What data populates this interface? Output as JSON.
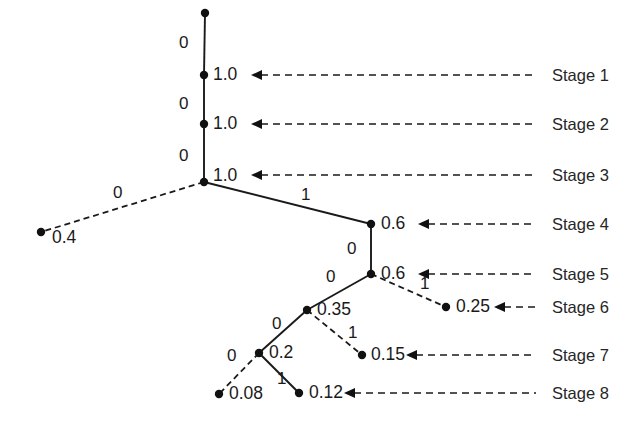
{
  "figure": {
    "type": "binary-decision-tree-diagram",
    "width": 631,
    "height": 426,
    "background_color": "#ffffff",
    "ink_color": "#1a1a1a"
  },
  "stage_labels": [
    {
      "id": "stage-1",
      "text": "Stage 1",
      "x": 552,
      "y": 67,
      "arrow": {
        "x_start": 536,
        "x_end": 251,
        "y": 75
      }
    },
    {
      "id": "stage-2",
      "text": "Stage 2",
      "x": 552,
      "y": 116,
      "arrow": {
        "x_start": 536,
        "x_end": 251,
        "y": 124
      }
    },
    {
      "id": "stage-3",
      "text": "Stage 3",
      "x": 552,
      "y": 167,
      "arrow": {
        "x_start": 536,
        "x_end": 251,
        "y": 175
      }
    },
    {
      "id": "stage-4",
      "text": "Stage 4",
      "x": 552,
      "y": 216,
      "arrow": {
        "x_start": 536,
        "x_end": 418,
        "y": 224
      }
    },
    {
      "id": "stage-5",
      "text": "Stage 5",
      "x": 552,
      "y": 266,
      "arrow": {
        "x_start": 536,
        "x_end": 418,
        "y": 274
      }
    },
    {
      "id": "stage-6",
      "text": "Stage 6",
      "x": 552,
      "y": 299,
      "arrow": {
        "x_start": 536,
        "x_end": 494,
        "y": 307
      }
    },
    {
      "id": "stage-7",
      "text": "Stage 7",
      "x": 552,
      "y": 347,
      "arrow": {
        "x_start": 536,
        "x_end": 406,
        "y": 355
      }
    },
    {
      "id": "stage-8",
      "text": "Stage 8",
      "x": 552,
      "y": 385,
      "arrow": {
        "x_start": 536,
        "x_end": 344,
        "y": 393
      }
    }
  ],
  "nodes": [
    {
      "id": "n-root",
      "value": "",
      "x": 205,
      "y": 13,
      "label_x": null,
      "label_y": null
    },
    {
      "id": "n-s1",
      "value": "1.0",
      "x": 204,
      "y": 75,
      "label_x": 213,
      "label_y": 66
    },
    {
      "id": "n-s2",
      "value": "1.0",
      "x": 204,
      "y": 124,
      "label_x": 213,
      "label_y": 115
    },
    {
      "id": "n-s3",
      "value": "1.0",
      "x": 204,
      "y": 182,
      "label_x": 213,
      "label_y": 167
    },
    {
      "id": "n-leaf-04",
      "value": "0.4",
      "x": 41,
      "y": 232,
      "label_x": 52,
      "label_y": 229
    },
    {
      "id": "n-s4",
      "value": "0.6",
      "x": 371,
      "y": 224,
      "label_x": 381,
      "label_y": 215
    },
    {
      "id": "n-s5",
      "value": "0.6",
      "x": 371,
      "y": 274,
      "label_x": 381,
      "label_y": 265
    },
    {
      "id": "n-leaf-025",
      "value": "0.25",
      "x": 446,
      "y": 307,
      "label_x": 456,
      "label_y": 298
    },
    {
      "id": "n-035",
      "value": "0.35",
      "x": 307,
      "y": 310,
      "label_x": 317,
      "label_y": 301
    },
    {
      "id": "n-leaf-015",
      "value": "0.15",
      "x": 362,
      "y": 355,
      "label_x": 371,
      "label_y": 346
    },
    {
      "id": "n-02",
      "value": "0.2",
      "x": 259,
      "y": 353,
      "label_x": 269,
      "label_y": 344
    },
    {
      "id": "n-leaf-008",
      "value": "0.08",
      "x": 219,
      "y": 394,
      "label_x": 229,
      "label_y": 385
    },
    {
      "id": "n-leaf-012",
      "value": "0.12",
      "x": 299,
      "y": 393,
      "label_x": 309,
      "label_y": 384
    }
  ],
  "edges": [
    {
      "id": "e-root-s1",
      "from": "n-root",
      "to": "n-s1",
      "style": "solid",
      "label": "0",
      "label_x": 179,
      "label_y": 34
    },
    {
      "id": "e-s1-s2",
      "from": "n-s1",
      "to": "n-s2",
      "style": "solid",
      "label": "0",
      "label_x": 179,
      "label_y": 95
    },
    {
      "id": "e-s2-s3",
      "from": "n-s2",
      "to": "n-s3",
      "style": "solid",
      "label": "0",
      "label_x": 179,
      "label_y": 147
    },
    {
      "id": "e-s3-leaf04",
      "from": "n-s3",
      "to": "n-leaf-04",
      "style": "dashed",
      "label": "0",
      "label_x": 113,
      "label_y": 184
    },
    {
      "id": "e-s3-s4",
      "from": "n-s3",
      "to": "n-s4",
      "style": "solid",
      "label": "1",
      "label_x": 301,
      "label_y": 186
    },
    {
      "id": "e-s4-s5",
      "from": "n-s4",
      "to": "n-s5",
      "style": "solid",
      "label": "0",
      "label_x": 347,
      "label_y": 240
    },
    {
      "id": "e-s5-leaf025",
      "from": "n-s5",
      "to": "n-leaf-025",
      "style": "dashed",
      "label": "1",
      "label_x": 420,
      "label_y": 275
    },
    {
      "id": "e-s5-035",
      "from": "n-s5",
      "to": "n-035",
      "style": "solid",
      "label": "0",
      "label_x": 326,
      "label_y": 268
    },
    {
      "id": "e-035-leaf015",
      "from": "n-035",
      "to": "n-leaf-015",
      "style": "dashed",
      "label": "1",
      "label_x": 348,
      "label_y": 324
    },
    {
      "id": "e-035-02",
      "from": "n-035",
      "to": "n-02",
      "style": "solid",
      "label": "0",
      "label_x": 272,
      "label_y": 315
    },
    {
      "id": "e-02-leaf008",
      "from": "n-02",
      "to": "n-leaf-008",
      "style": "dashed",
      "label": "0",
      "label_x": 227,
      "label_y": 347
    },
    {
      "id": "e-02-leaf012",
      "from": "n-02",
      "to": "n-leaf-012",
      "style": "solid",
      "label": "1",
      "label_x": 277,
      "label_y": 370
    }
  ]
}
